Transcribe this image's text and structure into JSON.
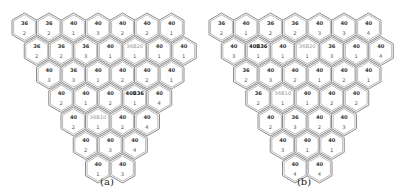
{
  "geometry": {
    "hex_w": 25,
    "hex_h": 29,
    "pitch_x": 24.5,
    "pitch_y": 23.5,
    "row_shift": 12.25,
    "top_y": 13
  },
  "panels": [
    {
      "id": "a",
      "caption": "(a)",
      "origin_x": 12,
      "caption_x": 107,
      "rows": [
        [
          [
            "36",
            "2"
          ],
          [
            "36",
            "2"
          ],
          [
            "40",
            "1"
          ],
          [
            "40",
            "3"
          ],
          [
            "40",
            "2"
          ],
          [
            "40",
            "2"
          ],
          [
            "40",
            "1"
          ]
        ],
        [
          [
            "36",
            "2"
          ],
          [
            "36",
            "2"
          ],
          [
            "36",
            "3"
          ],
          [
            "40",
            "1"
          ],
          [
            "36B20",
            "1"
          ],
          [
            "40",
            "1"
          ],
          [
            "40",
            "1"
          ]
        ],
        [
          [
            "40",
            "3"
          ],
          [
            "36",
            "3"
          ],
          [
            "40",
            "1"
          ],
          [
            "40",
            "2"
          ],
          [
            "40",
            "2"
          ],
          [
            "40",
            "1"
          ]
        ],
        [
          [
            "40",
            "2"
          ],
          [
            "40",
            "1"
          ],
          [
            "40",
            "2"
          ],
          [
            "40B36",
            "1"
          ],
          [
            "40",
            "4"
          ]
        ],
        [
          [
            "40",
            "2"
          ],
          [
            "36B10",
            "1"
          ],
          [
            "40",
            "2"
          ],
          [
            "40",
            "4"
          ]
        ],
        [
          [
            "40",
            "2"
          ],
          [
            "40",
            "3"
          ],
          [
            "40",
            "4"
          ]
        ],
        [
          [
            "40",
            "1"
          ],
          [
            "40",
            "3"
          ]
        ]
      ]
    },
    {
      "id": "b",
      "caption": "(b)",
      "origin_x": 209,
      "caption_x": 304,
      "rows": [
        [
          [
            "36",
            "2"
          ],
          [
            "40",
            "1"
          ],
          [
            "36",
            "2"
          ],
          [
            "36",
            "2"
          ],
          [
            "40",
            "3"
          ],
          [
            "40",
            "3"
          ],
          [
            "40",
            "4"
          ]
        ],
        [
          [
            "40",
            "3"
          ],
          [
            "40B36",
            "1"
          ],
          [
            "40",
            "1"
          ],
          [
            "36B20",
            "1"
          ],
          [
            "36",
            "3"
          ],
          [
            "40",
            "1"
          ],
          [
            "40",
            "4"
          ]
        ],
        [
          [
            "36",
            "2"
          ],
          [
            "40",
            "3"
          ],
          [
            "40",
            "2"
          ],
          [
            "40",
            "1"
          ],
          [
            "40",
            "2"
          ],
          [
            "40",
            "1"
          ]
        ],
        [
          [
            "36",
            "2"
          ],
          [
            "36B10",
            "1"
          ],
          [
            "40",
            "1"
          ],
          [
            "40",
            "2"
          ],
          [
            "40",
            "2"
          ]
        ],
        [
          [
            "40",
            "2"
          ],
          [
            "36",
            "3"
          ],
          [
            "40",
            "2"
          ],
          [
            "40",
            "3"
          ]
        ],
        [
          [
            "40",
            "3"
          ],
          [
            "40",
            "1"
          ],
          [
            "40",
            "1"
          ]
        ],
        [
          [
            "40",
            "4"
          ],
          [
            "40",
            "4"
          ]
        ]
      ]
    }
  ]
}
